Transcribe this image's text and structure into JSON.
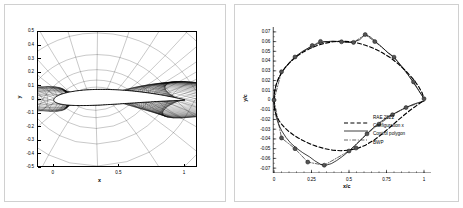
{
  "figure": {
    "panel_count": 2,
    "background": "#ffffff",
    "border_color": "#d0d0d0"
  },
  "left_panel": {
    "name": "computational-mesh-around-airfoil",
    "chart_data": {
      "type": "line",
      "title": "",
      "xlabel": "x",
      "ylabel": "y",
      "xlim": [
        -0.12,
        1.1
      ],
      "ylim": [
        -0.5,
        0.5
      ],
      "xticks": [
        0,
        0.5,
        1
      ],
      "xticklabels": [
        "0",
        "0.5",
        "1"
      ],
      "yticks": [
        -0.5,
        -0.4,
        -0.3,
        -0.2,
        -0.1,
        0,
        0.1,
        0.2,
        0.3,
        0.4,
        0.5
      ],
      "yticklabels": [
        "-0.5",
        "-0.4",
        "-0.3",
        "-0.2",
        "-0.1",
        "0",
        "0.1",
        "0.2",
        "0.3",
        "0.4",
        "0.5"
      ],
      "grid": false,
      "description": "C-type structured body-fitted grid clustered around an RAE 2822 supercritical airfoil section; radial mesh lines emanate from the surface, circumferential lines wrap the profile and trail downstream.",
      "series": [
        {
          "name": "grid-radial-lines",
          "count": 96,
          "color": "#000000"
        },
        {
          "name": "grid-circumferential-lines",
          "count": 40,
          "color": "#000000"
        },
        {
          "name": "airfoil-surface",
          "color": "#000000",
          "fill": "#ffffff"
        }
      ],
      "airfoil": {
        "name": "RAE 2822",
        "chord": 1.0,
        "max_thickness_ratio": 0.121,
        "leading_edge": [
          0,
          0
        ],
        "trailing_edge": [
          1,
          0
        ]
      }
    }
  },
  "right_panel": {
    "name": "airfoil-geometry-comparison",
    "chart_data": {
      "type": "line",
      "title": "",
      "xlabel": "x/c",
      "ylabel": "y/c",
      "xlim": [
        -0.06,
        1.06
      ],
      "ylim": [
        -0.075,
        0.075
      ],
      "xticks": [
        0,
        0.25,
        0.5,
        0.75,
        1
      ],
      "xticklabels": [
        "0",
        "0.25",
        "0.5",
        "0.75",
        "1"
      ],
      "xminorticks": 0.05,
      "yticks": [
        -0.07,
        -0.06,
        -0.05,
        -0.04,
        -0.03,
        -0.02,
        -0.01,
        0,
        0.01,
        0.02,
        0.03,
        0.04,
        0.05,
        0.06,
        0.07
      ],
      "yticklabels": [
        "-0.07",
        "-0.06",
        "-0.05",
        "-0.04",
        "-0.03",
        "-0.02",
        "-0.01",
        "0",
        "0.01",
        "0.02",
        "0.03",
        "0.04",
        "0.05",
        "0.06",
        "0.07"
      ],
      "grid": false,
      "legend_position": "lower-right",
      "series": [
        {
          "name": "RAE 2822",
          "style": "dashed",
          "color": "#000000",
          "upper": [
            [
              0.0,
              0.0
            ],
            [
              0.002,
              0.0063
            ],
            [
              0.008,
              0.012
            ],
            [
              0.018,
              0.0176
            ],
            [
              0.032,
              0.0229
            ],
            [
              0.05,
              0.028
            ],
            [
              0.072,
              0.0328
            ],
            [
              0.098,
              0.0374
            ],
            [
              0.128,
              0.0418
            ],
            [
              0.162,
              0.0459
            ],
            [
              0.2,
              0.0497
            ],
            [
              0.242,
              0.0531
            ],
            [
              0.288,
              0.056
            ],
            [
              0.338,
              0.0583
            ],
            [
              0.39,
              0.0598
            ],
            [
              0.445,
              0.0604
            ],
            [
              0.5,
              0.06
            ],
            [
              0.555,
              0.0586
            ],
            [
              0.61,
              0.0563
            ],
            [
              0.665,
              0.053
            ],
            [
              0.72,
              0.0488
            ],
            [
              0.775,
              0.0435
            ],
            [
              0.828,
              0.0372
            ],
            [
              0.878,
              0.03
            ],
            [
              0.924,
              0.0222
            ],
            [
              0.962,
              0.0144
            ],
            [
              0.988,
              0.0072
            ],
            [
              1.0,
              0.0013
            ]
          ],
          "lower": [
            [
              0.0,
              0.0
            ],
            [
              0.002,
              -0.0063
            ],
            [
              0.008,
              -0.0118
            ],
            [
              0.018,
              -0.0166
            ],
            [
              0.032,
              -0.0209
            ],
            [
              0.05,
              -0.0248
            ],
            [
              0.072,
              -0.0286
            ],
            [
              0.098,
              -0.0322
            ],
            [
              0.128,
              -0.0357
            ],
            [
              0.162,
              -0.039
            ],
            [
              0.2,
              -0.0422
            ],
            [
              0.242,
              -0.0452
            ],
            [
              0.288,
              -0.0478
            ],
            [
              0.338,
              -0.05
            ],
            [
              0.39,
              -0.0515
            ],
            [
              0.445,
              -0.0521
            ],
            [
              0.5,
              -0.0516
            ],
            [
              0.555,
              -0.0498
            ],
            [
              0.61,
              -0.0464
            ],
            [
              0.665,
              -0.0414
            ],
            [
              0.72,
              -0.035
            ],
            [
              0.775,
              -0.0278
            ],
            [
              0.828,
              -0.0206
            ],
            [
              0.878,
              -0.0141
            ],
            [
              0.924,
              -0.0086
            ],
            [
              0.962,
              -0.0045
            ],
            [
              0.988,
              -0.0016
            ],
            [
              1.0,
              -0.0013
            ]
          ]
        },
        {
          "name": "Configuration x",
          "style": "solid",
          "color": "#000000",
          "upper": [
            [
              0.0,
              0.0
            ],
            [
              0.004,
              0.008
            ],
            [
              0.014,
              0.0155
            ],
            [
              0.03,
              0.0222
            ],
            [
              0.052,
              0.0285
            ],
            [
              0.08,
              0.0346
            ],
            [
              0.112,
              0.0402
            ],
            [
              0.15,
              0.0455
            ],
            [
              0.192,
              0.0502
            ],
            [
              0.238,
              0.0542
            ],
            [
              0.288,
              0.0576
            ],
            [
              0.34,
              0.0598
            ],
            [
              0.392,
              0.0605
            ],
            [
              0.442,
              0.06
            ],
            [
              0.488,
              0.0592
            ],
            [
              0.53,
              0.0594
            ],
            [
              0.572,
              0.062
            ],
            [
              0.606,
              0.0672
            ],
            [
              0.64,
              0.065
            ],
            [
              0.68,
              0.0596
            ],
            [
              0.722,
              0.054
            ],
            [
              0.762,
              0.048
            ],
            [
              0.8,
              0.044
            ],
            [
              0.84,
              0.0368
            ],
            [
              0.88,
              0.029
            ],
            [
              0.92,
              0.02
            ],
            [
              0.96,
              0.0108
            ],
            [
              1.0,
              0.0013
            ]
          ],
          "lower": [
            [
              0.0,
              0.0
            ],
            [
              0.004,
              -0.009
            ],
            [
              0.014,
              -0.0172
            ],
            [
              0.03,
              -0.0248
            ],
            [
              0.052,
              -0.0318
            ],
            [
              0.08,
              -0.0385
            ],
            [
              0.112,
              -0.0444
            ],
            [
              0.15,
              -0.0495
            ],
            [
              0.192,
              -0.0542
            ],
            [
              0.238,
              -0.0585
            ],
            [
              0.272,
              -0.0625
            ],
            [
              0.31,
              -0.066
            ],
            [
              0.346,
              -0.067
            ],
            [
              0.382,
              -0.0654
            ],
            [
              0.418,
              -0.0622
            ],
            [
              0.458,
              -0.0578
            ],
            [
              0.5,
              -0.0524
            ],
            [
              0.545,
              -0.0462
            ],
            [
              0.588,
              -0.0396
            ],
            [
              0.63,
              -0.033
            ],
            [
              0.672,
              -0.0272
            ],
            [
              0.715,
              -0.022
            ],
            [
              0.758,
              -0.0176
            ],
            [
              0.8,
              -0.014
            ],
            [
              0.842,
              -0.0106
            ],
            [
              0.884,
              -0.0074
            ],
            [
              0.926,
              -0.0046
            ],
            [
              0.964,
              -0.0026
            ],
            [
              1.0,
              -0.0013
            ]
          ]
        },
        {
          "name": "Control polygon",
          "style": "dash-dot",
          "color": "#000000",
          "upper": [
            [
              0.0,
              0.0
            ],
            [
              0.05,
              0.029
            ],
            [
              0.14,
              0.0442
            ],
            [
              0.255,
              0.056
            ],
            [
              0.31,
              0.0602
            ],
            [
              0.45,
              0.0598
            ],
            [
              0.53,
              0.0592
            ],
            [
              0.608,
              0.0672
            ],
            [
              0.672,
              0.06
            ],
            [
              0.8,
              0.044
            ],
            [
              0.93,
              0.0186
            ],
            [
              1.0,
              0.0013
            ]
          ],
          "lower": [
            [
              0.0,
              0.0
            ],
            [
              0.05,
              -0.039
            ],
            [
              0.14,
              -0.05
            ],
            [
              0.225,
              -0.0638
            ],
            [
              0.335,
              -0.067
            ],
            [
              0.5,
              -0.0524
            ],
            [
              0.62,
              -0.0348
            ],
            [
              0.7,
              -0.0248
            ],
            [
              0.79,
              -0.0152
            ],
            [
              0.88,
              -0.0078
            ],
            [
              1.0,
              -0.0013
            ]
          ]
        },
        {
          "name": "BWP",
          "style": "marker",
          "marker": "filled-circle",
          "color": "#555555",
          "points": [
            [
              0.0,
              0.0
            ],
            [
              0.05,
              0.029
            ],
            [
              0.14,
              0.0442
            ],
            [
              0.255,
              0.056
            ],
            [
              0.31,
              0.0602
            ],
            [
              0.45,
              0.0598
            ],
            [
              0.53,
              0.0592
            ],
            [
              0.608,
              0.0672
            ],
            [
              0.672,
              0.06
            ],
            [
              0.8,
              0.044
            ],
            [
              0.93,
              0.0186
            ],
            [
              1.0,
              0.0013
            ],
            [
              0.05,
              -0.039
            ],
            [
              0.14,
              -0.05
            ],
            [
              0.225,
              -0.0638
            ],
            [
              0.335,
              -0.067
            ],
            [
              0.5,
              -0.0524
            ],
            [
              0.62,
              -0.0348
            ],
            [
              0.7,
              -0.0248
            ],
            [
              0.79,
              -0.0152
            ],
            [
              0.88,
              -0.0078
            ]
          ]
        }
      ]
    },
    "legend": {
      "entries": [
        {
          "label": "RAE 2822",
          "style": "dashed"
        },
        {
          "label": "Configuration x",
          "style": "solid"
        },
        {
          "label": "Control polygon",
          "style": "dash-dot"
        },
        {
          "label": "BWP",
          "style": "marker"
        }
      ]
    }
  }
}
